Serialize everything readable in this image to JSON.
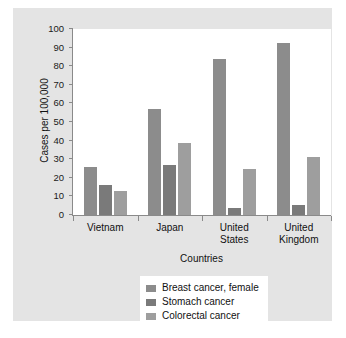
{
  "chart_data": {
    "type": "bar",
    "title": "",
    "xlabel": "Countries",
    "ylabel": "Cases per 100,000",
    "ylim": [
      0,
      100
    ],
    "ytick_labels": [
      "100",
      "90",
      "80",
      "70",
      "60",
      "50",
      "40",
      "30",
      "20",
      "10",
      "0"
    ],
    "ytick_values": [
      100,
      90,
      80,
      70,
      60,
      50,
      40,
      30,
      20,
      10,
      0
    ],
    "grid": false,
    "legend_position": "bottom-center",
    "categories": [
      "Vietnam",
      "Japan",
      "United States",
      "United Kingdom"
    ],
    "series": [
      {
        "name": "Breast cancer, female",
        "color": "#8c8c8c",
        "values": [
          26,
          57,
          84,
          92.5
        ]
      },
      {
        "name": "Stomach cancer",
        "color": "#7a7a7a",
        "values": [
          16,
          27,
          4,
          5.5
        ]
      },
      {
        "name": "Colorectal cancer",
        "color": "#9e9e9e",
        "values": [
          13,
          38.5,
          25,
          31
        ]
      }
    ]
  },
  "figure": {
    "background_color": "#ffffff",
    "panel_color": "#e4e4e4",
    "plot_background_color": "#ffffff",
    "axis_color": "#8a8a8a"
  }
}
